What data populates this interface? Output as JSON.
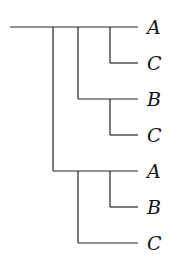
{
  "diagram": {
    "type": "tree",
    "leaves": [
      {
        "label": "A",
        "y": 27
      },
      {
        "label": "C",
        "y": 63
      },
      {
        "label": "B",
        "y": 99
      },
      {
        "label": "C",
        "y": 135
      },
      {
        "label": "A",
        "y": 171
      },
      {
        "label": "B",
        "y": 207
      },
      {
        "label": "C",
        "y": 243
      }
    ]
  }
}
